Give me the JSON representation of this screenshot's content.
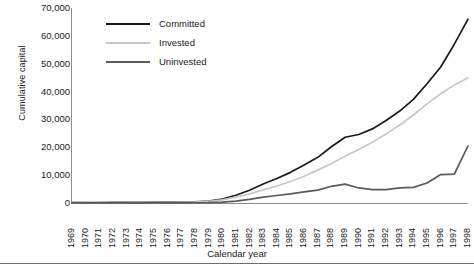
{
  "chart_data": {
    "type": "line",
    "title": "",
    "xlabel": "Calendar year",
    "ylabel": "Cumulative capital",
    "grid": false,
    "legend_position": "top-left-inside",
    "xlim": [
      1969,
      1998
    ],
    "ylim": [
      0,
      70000
    ],
    "ytick_labels": [
      "70,000",
      "60,000",
      "50,000",
      "40,000",
      "30,000",
      "20,000",
      "10,000",
      "0"
    ],
    "ytick_values": [
      70000,
      60000,
      50000,
      40000,
      30000,
      20000,
      10000,
      0
    ],
    "categories": [
      "1969",
      "1970",
      "1971",
      "1972",
      "1973",
      "1974",
      "1975",
      "1976",
      "1977",
      "1978",
      "1979",
      "1980",
      "1981",
      "1982",
      "1983",
      "1984",
      "1985",
      "1986",
      "1987",
      "1988",
      "1989",
      "1990",
      "1991",
      "1992",
      "1993",
      "1994",
      "1995",
      "1996",
      "1997",
      "1998"
    ],
    "series": [
      {
        "name": "Committed",
        "color": "#1a1a1a",
        "values": [
          100,
          130,
          160,
          190,
          220,
          250,
          290,
          330,
          380,
          450,
          700,
          1400,
          2800,
          4600,
          6800,
          8800,
          11000,
          13600,
          16400,
          20200,
          23600,
          24600,
          26600,
          29600,
          33000,
          37200,
          42800,
          48800,
          57000,
          66000
        ]
      },
      {
        "name": "Invested",
        "color": "#c8c8c8",
        "values": [
          80,
          100,
          125,
          150,
          175,
          200,
          230,
          265,
          305,
          360,
          560,
          1100,
          2100,
          3300,
          4700,
          6100,
          7700,
          9600,
          11800,
          14200,
          16800,
          19200,
          21800,
          24800,
          28000,
          31600,
          35600,
          39200,
          42400,
          45000
        ]
      },
      {
        "name": "Uninvested",
        "color": "#5a5a5a",
        "values": [
          20,
          30,
          35,
          40,
          45,
          50,
          60,
          65,
          75,
          90,
          140,
          300,
          700,
          1300,
          2100,
          2700,
          3300,
          4000,
          4600,
          6000,
          6800,
          5400,
          4800,
          4800,
          5400,
          5600,
          7200,
          10200,
          10400,
          20500
        ]
      }
    ]
  },
  "legend": {
    "items": [
      {
        "label": "Committed"
      },
      {
        "label": "Invested"
      },
      {
        "label": "Uninvested"
      }
    ]
  }
}
